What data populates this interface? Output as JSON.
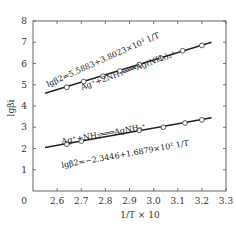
{
  "chart_data": {
    "type": "scatter",
    "title": "",
    "xlabel": "1/T × 10",
    "ylabel": "lgβi",
    "xlim": [
      2.5,
      3.3
    ],
    "ylim": [
      0,
      8
    ],
    "x_ticks": [
      "2.6",
      "2.7",
      "2.8",
      "2.9",
      "3.0",
      "3.1",
      "3.2",
      "3.3"
    ],
    "y_ticks": [
      "1",
      "2",
      "3",
      "4",
      "5",
      "6",
      "7",
      "8"
    ],
    "origin_label": "0",
    "grid": false,
    "series": [
      {
        "name": "Ag+ + 2NH3 = Ag(NH3)2+",
        "equation": "lgβ2=5.5883+3.8023×10³ 1/T",
        "reaction": "Ag⁺+2NH₃═══Ag(NH₃)₂⁺",
        "x": [
          2.64,
          2.71,
          2.79,
          2.86,
          2.94,
          3.03,
          3.12,
          3.2
        ],
        "y": [
          4.88,
          5.15,
          5.4,
          5.65,
          5.95,
          6.25,
          6.6,
          6.85
        ],
        "fit_x": [
          2.55,
          3.24
        ],
        "fit_y": [
          4.6,
          7.0
        ]
      },
      {
        "name": "Ag+ + NH3 = AgNH3+",
        "equation": "lgβ2=−2.3446+1.6879×10² 1/T",
        "reaction": "Ag⁺+NH₃═══AgNH₃⁺",
        "x": [
          2.64,
          2.7,
          2.94,
          3.04,
          3.13,
          3.2
        ],
        "y": [
          2.2,
          2.35,
          2.85,
          3.0,
          3.2,
          3.35
        ],
        "fit_x": [
          2.55,
          3.24
        ],
        "fit_y": [
          2.05,
          3.45
        ]
      }
    ]
  }
}
